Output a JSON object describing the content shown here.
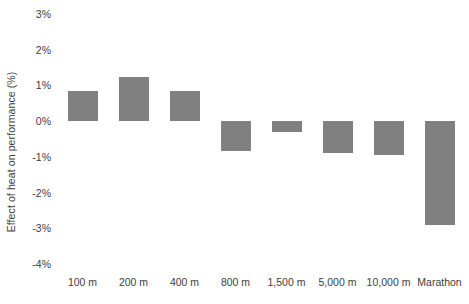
{
  "chart_data": {
    "type": "bar",
    "title": "",
    "xlabel": "",
    "ylabel": "Effect of heat on performance (%)",
    "categories": [
      "100 m",
      "200 m",
      "400 m",
      "800 m",
      "1,500 m",
      "5,000 m",
      "10,000 m",
      "Marathon"
    ],
    "values": [
      0.85,
      1.25,
      0.85,
      -0.85,
      -0.3,
      -0.9,
      -0.95,
      -2.9
    ],
    "value_labels": [
      "0.85%",
      "1.25%",
      "0.85%",
      "-0.85%",
      "-0.3%",
      "-0.9%",
      "-0.95%",
      "-2.9%"
    ],
    "ylim": [
      -4,
      3
    ],
    "ytick_values": [
      3,
      2,
      1,
      0,
      -1,
      -2,
      -3,
      -4
    ],
    "ytick_labels": [
      "3%",
      "2%",
      "1%",
      "0%",
      "-1%",
      "-2%",
      "-3%",
      "-4%"
    ],
    "grid": false,
    "legend": null,
    "bar_color": "#808080",
    "background_color": "#ffffff",
    "text_color": "#3d3d3d"
  }
}
